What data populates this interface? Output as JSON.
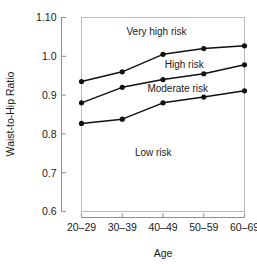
{
  "chart_data": {
    "type": "line",
    "title": "",
    "xlabel": "Age",
    "ylabel": "Waist-to-Hip Ratio",
    "categories": [
      "20–29",
      "30–39",
      "40–49",
      "50–59",
      "60–69"
    ],
    "ylim": [
      0.6,
      1.1
    ],
    "xlim": [
      0,
      4
    ],
    "yticks": [
      0.6,
      0.7,
      0.8,
      0.9,
      1.0,
      1.1
    ],
    "ytick_labels": [
      "0.6",
      "0.7",
      "0.8",
      "0.9",
      "1.0",
      "1.10"
    ],
    "grid": false,
    "legend": "none",
    "series": [
      {
        "name": "Very high risk boundary",
        "values": [
          0.935,
          0.96,
          1.005,
          1.02,
          1.027
        ],
        "color": "#111111",
        "marker": "circle"
      },
      {
        "name": "High risk boundary",
        "values": [
          0.88,
          0.92,
          0.94,
          0.955,
          0.978
        ],
        "color": "#111111",
        "marker": "circle"
      },
      {
        "name": "Moderate risk boundary",
        "values": [
          0.827,
          0.838,
          0.88,
          0.895,
          0.911
        ],
        "color": "#111111",
        "marker": "circle"
      }
    ],
    "annotations": [
      {
        "text": "Very high risk",
        "x_frac": 0.46,
        "y_value": 1.063,
        "anchor": "middle"
      },
      {
        "text": "High risk",
        "x_frac": 0.63,
        "y_value": 0.979,
        "anchor": "middle"
      },
      {
        "text": "Moderate risk",
        "x_frac": 0.59,
        "y_value": 0.918,
        "anchor": "middle"
      },
      {
        "text": "Low risk",
        "x_frac": 0.44,
        "y_value": 0.752,
        "anchor": "middle"
      }
    ]
  },
  "colors": {
    "line": "#111111",
    "marker": "#111111",
    "frame": "#b9b9b9",
    "spine": "#8f8f8f",
    "text": "#1a1a1a",
    "background": "#ffffff"
  }
}
